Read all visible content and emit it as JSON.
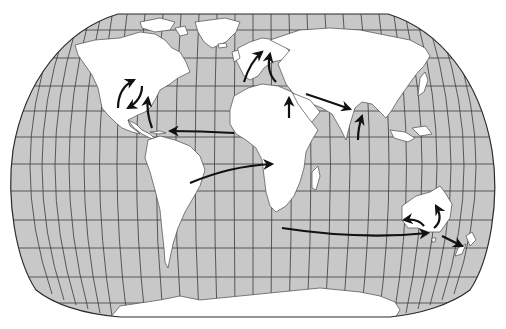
{
  "map": {
    "projection": "robinson-like world map",
    "colors": {
      "ocean": "#c8c8c8",
      "land": "#ffffff",
      "graticule": "#3a3a3a",
      "coastline": "#4a4a4a",
      "arrow": "#111111",
      "border": "#2a2a2a"
    },
    "regions": [
      "North America",
      "Greenland",
      "South America",
      "Europe",
      "Africa",
      "Asia",
      "Australia",
      "New Zealand",
      "Antarctica",
      "Madagascar"
    ],
    "arrows": [
      {
        "id": "na-loop-west",
        "description": "curved arrow within central North America pointing north-east"
      },
      {
        "id": "na-loop-south",
        "description": "curved arrow in North America pointing south-west toward Gulf of Mexico"
      },
      {
        "id": "caribbean-north",
        "description": "arrow from Caribbean north toward eastern United States"
      },
      {
        "id": "africa-to-caribbean",
        "description": "arrow from West Africa westward to the Caribbean"
      },
      {
        "id": "africa-to-iberia",
        "description": "arrow from north-west Africa north to western Europe"
      },
      {
        "id": "mediterranean-to-europe",
        "description": "arrow from Mediterranean north to central Europe"
      },
      {
        "id": "africa-north",
        "description": "arrow from north-east Africa north toward Egypt"
      },
      {
        "id": "middle-east-to-india",
        "description": "arrow from Middle East east to India"
      },
      {
        "id": "india-north",
        "description": "arrow from southern India north"
      },
      {
        "id": "south-america-to-africa",
        "description": "arrow from Brazil east to central Africa"
      },
      {
        "id": "south-africa-to-australia",
        "description": "long arrow from South Africa east to south-east Australia"
      },
      {
        "id": "australia-west",
        "description": "curved arrow within Australia pointing west"
      },
      {
        "id": "australia-north",
        "description": "curved arrow within Australia pointing north"
      },
      {
        "id": "australia-to-nz",
        "description": "arrow from south-east Australia to New Zealand"
      }
    ]
  }
}
